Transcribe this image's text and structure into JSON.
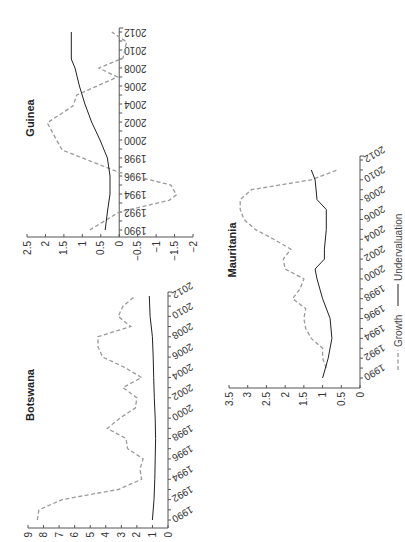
{
  "legend": {
    "growth_label": "Growth",
    "undervaluation_label": "Undervaluation"
  },
  "panels": {
    "guinea": {
      "title": "Guinea"
    },
    "botswana": {
      "title": "Botswana"
    },
    "mauritania": {
      "title": "Mauritania"
    }
  },
  "chart_data": [
    {
      "type": "line",
      "title": "Guinea",
      "x": [
        1990,
        1992,
        1993.3,
        1993.9,
        1995,
        1996.4,
        1998.9,
        2001.9,
        2003.8,
        2005,
        2007,
        2008,
        2009.1,
        2010.9,
        2012
      ],
      "xlabel": "",
      "ylabel": "",
      "x_ticks": [
        1990,
        1992,
        1994,
        1996,
        1998,
        2000,
        2002,
        2004,
        2006,
        2008,
        2010,
        2012
      ],
      "y_ticks": [
        2.5,
        2,
        1.5,
        1,
        0.5,
        0,
        -0.5,
        -1,
        -1.5,
        -2
      ],
      "ylim": [
        -2,
        2.5
      ],
      "series": [
        {
          "name": "Growth",
          "style": "dashed",
          "x": [
            1990,
            1992,
            1993.3,
            1993.9,
            1995,
            1996.4,
            1998.9,
            2001.9,
            2003.8,
            2005,
            2007,
            2008,
            2009.1,
            2010.9,
            2012
          ],
          "values": [
            0.8,
            0.0,
            -1.35,
            -1.55,
            -1.4,
            0.0,
            1.55,
            1.95,
            1.25,
            1.15,
            0.05,
            0.55,
            -0.1,
            -0.2,
            0.2
          ]
        },
        {
          "name": "Undervaluation",
          "style": "solid",
          "x": [
            1990,
            1992,
            1994,
            1996,
            1998,
            2000,
            2002,
            2004,
            2006,
            2008,
            2009,
            2010,
            2012
          ],
          "values": [
            0.38,
            0.32,
            0.25,
            0.25,
            0.32,
            0.52,
            0.75,
            0.93,
            1.08,
            1.2,
            1.3,
            1.3,
            1.3
          ]
        }
      ],
      "orientation": "rotated 90deg: year axis vertical (increasing upward), value axis horizontal (decreasing left to right)"
    },
    {
      "type": "line",
      "title": "Botswana",
      "xlabel": "",
      "ylabel": "",
      "x_ticks": [
        1990,
        1992,
        1994,
        1996,
        1998,
        2000,
        2002,
        2004,
        2006,
        2008,
        2010,
        2012
      ],
      "y_ticks": [
        9,
        8,
        7,
        6,
        5,
        4,
        3,
        2,
        1,
        0
      ],
      "ylim": [
        0,
        9
      ],
      "series": [
        {
          "name": "Growth",
          "style": "dashed",
          "x": [
            1990,
            1991,
            1992,
            1993,
            1994,
            1995,
            1996,
            1997,
            1998,
            1999,
            2000,
            2001,
            2002,
            2003,
            2004,
            2005,
            2006,
            2007,
            2008,
            2009,
            2010,
            2011,
            2012
          ],
          "values": [
            8.4,
            8.3,
            6.8,
            3.2,
            1.7,
            1.8,
            1.6,
            2.6,
            2.7,
            3.9,
            3.1,
            2.1,
            2.0,
            2.9,
            1.7,
            2.8,
            4.2,
            4.5,
            4.5,
            2.4,
            3.2,
            2.9,
            2.1
          ]
        },
        {
          "name": "Undervaluation",
          "style": "solid",
          "x": [
            1990,
            1992,
            1994,
            1996,
            1998,
            2000,
            2002,
            2004,
            2006,
            2008,
            2010,
            2012
          ],
          "values": [
            1.0,
            0.9,
            0.85,
            0.82,
            0.8,
            0.82,
            0.88,
            0.92,
            0.95,
            1.0,
            1.15,
            1.2
          ]
        }
      ]
    },
    {
      "type": "line",
      "title": "Mauritania",
      "xlabel": "",
      "ylabel": "",
      "x_ticks": [
        1990,
        1992,
        1994,
        1996,
        1998,
        2000,
        2002,
        2004,
        2006,
        2008,
        2010,
        2012
      ],
      "y_ticks": [
        3.5,
        3,
        2.5,
        2,
        1.5,
        1,
        0.5,
        0
      ],
      "ylim": [
        0,
        3.5
      ],
      "series": [
        {
          "name": "Growth",
          "style": "dashed",
          "x": [
            1991,
            1992,
            1993,
            1994,
            1995,
            1996,
            1997,
            1998,
            1999,
            2000,
            2001,
            2002,
            2003,
            2004,
            2005,
            2006,
            2007,
            2008,
            2009,
            2010,
            2011
          ],
          "values": [
            0.9,
            1.0,
            1.0,
            1.3,
            1.45,
            1.5,
            1.45,
            1.8,
            1.6,
            1.5,
            2.0,
            2.05,
            1.85,
            2.3,
            2.8,
            3.1,
            3.2,
            3.2,
            2.9,
            1.3,
            0.6
          ]
        },
        {
          "name": "Undervaluation",
          "style": "solid",
          "x": [
            1990,
            1992,
            1994,
            1996,
            1998,
            2000,
            2001,
            2002,
            2003,
            2005,
            2007,
            2008,
            2010,
            2011
          ],
          "values": [
            1.0,
            0.85,
            0.75,
            0.8,
            1.0,
            1.15,
            1.2,
            0.95,
            0.95,
            0.9,
            0.9,
            1.15,
            1.2,
            1.3
          ]
        }
      ]
    }
  ]
}
